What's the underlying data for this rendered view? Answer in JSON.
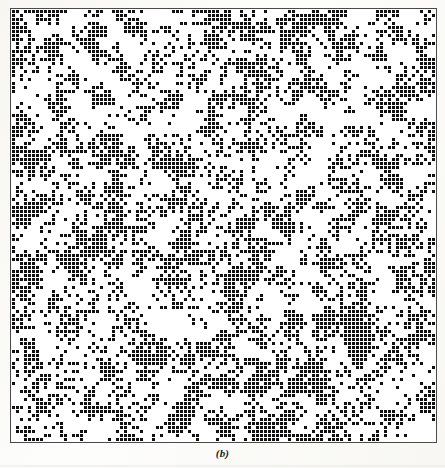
{
  "figure": {
    "caption": "(b)",
    "colors": {
      "occupied_site": "#111111",
      "empty_site": "#ffffff",
      "frame": "#4a4a4a",
      "paper": "#fdfdfb"
    }
  },
  "chart_data": {
    "type": "heatmap",
    "subtitle": "(b)",
    "xlabel": "",
    "ylabel": "",
    "grid": false,
    "legend_position": "none",
    "cell_size_px": 4,
    "cell_gap_px": 1,
    "columns": 106,
    "rows": 108,
    "value_labels": {
      "0": "empty site",
      "1": "occupied site"
    },
    "colorscale": [
      {
        "value": 0,
        "color": "#ffffff"
      },
      {
        "value": 1,
        "color": "#111111"
      }
    ],
    "occupation_probability": 0.42,
    "cluster_correlation_length_cells": 3.1,
    "random_seed": 20240517,
    "annotations": [
      {
        "text": "(b)",
        "position": "below-axes-center"
      }
    ],
    "axis_frame": {
      "visible": true,
      "color": "#4a4a4a",
      "line_width_px": 1,
      "x_px": 10,
      "y_px": 8,
      "width_px": 427,
      "height_px": 435
    }
  }
}
